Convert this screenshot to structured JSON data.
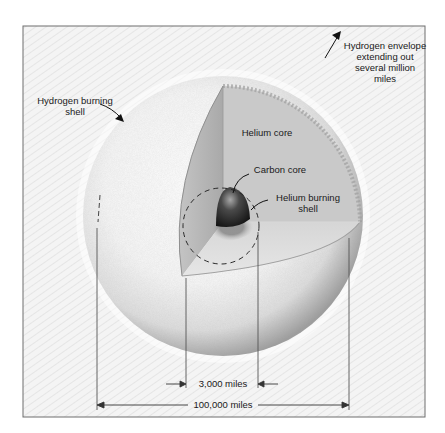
{
  "diagram": {
    "labels": {
      "hydrogen_envelope": [
        "Hydrogen envelope",
        "extending out",
        "several million",
        "miles"
      ],
      "hydrogen_burning_shell": [
        "Hydrogen burning",
        "shell"
      ],
      "helium_core": "Helium core",
      "carbon_core": "Carbon core",
      "helium_burning_shell": [
        "Helium burning",
        "shell"
      ]
    },
    "dimensions": {
      "inner": "3,000  miles",
      "outer": "100,000 miles"
    },
    "colors": {
      "background": "#ffffff",
      "frame_border": "#6e6e6e",
      "rays": "#c8c8c8",
      "sphere_light": "#fafafa",
      "sphere_edge": "#9a9a9a",
      "helium_core_face": "#c9c9c9",
      "helium_core_side": "#b2b2b2",
      "cut_floor": "#dcdcdc",
      "carbon_core_dark": "#1e1e1e",
      "carbon_core_highlight": "#9a9a9a",
      "text": "#1a1a1a"
    }
  }
}
